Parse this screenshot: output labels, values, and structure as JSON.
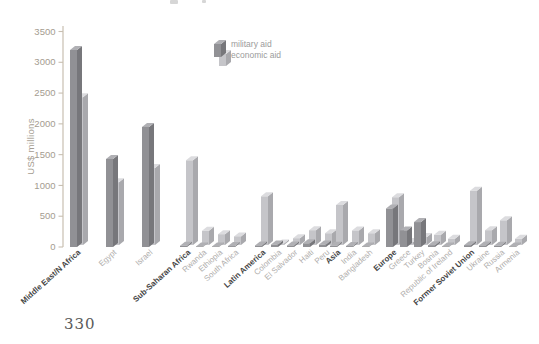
{
  "page": {
    "page_number": "330"
  },
  "chart_data": {
    "type": "bar",
    "ylabel": "US$ millions",
    "ylim": [
      0,
      3500
    ],
    "y_ticks": [
      0,
      500,
      1000,
      1500,
      2000,
      2500,
      3000,
      3500
    ],
    "grid": false,
    "legend_position": "top-center",
    "legend": [
      {
        "name": "military aid",
        "color": "#919195"
      },
      {
        "name": "economic aid",
        "color": "#c5c5c9"
      }
    ],
    "series_names": [
      "military aid",
      "economic aid"
    ],
    "units": "US$ millions",
    "groups": [
      {
        "region": "Middle East/N Africa",
        "entries": [
          {
            "label": "Middle East/N Africa",
            "bold": true,
            "military": 3200,
            "economic": 2400
          },
          {
            "label": "Egypt",
            "bold": false,
            "military": 1430,
            "economic": 1020
          },
          {
            "label": "Israel",
            "bold": false,
            "military": 1950,
            "economic": 1250
          }
        ]
      },
      {
        "region": "Sub-Saharan Africa",
        "entries": [
          {
            "label": "Sub-Saharan Africa",
            "bold": true,
            "military": 20,
            "economic": 1375
          },
          {
            "label": "Rwanda",
            "bold": false,
            "military": 10,
            "economic": 230
          },
          {
            "label": "Ethiopia",
            "bold": false,
            "military": 10,
            "economic": 175
          },
          {
            "label": "South Africa",
            "bold": false,
            "military": 15,
            "economic": 140
          }
        ]
      },
      {
        "region": "Latin America",
        "entries": [
          {
            "label": "Latin America",
            "bold": true,
            "military": 25,
            "economic": 790
          },
          {
            "label": "Colombia",
            "bold": false,
            "military": 40,
            "economic": 25
          },
          {
            "label": "El Salvador",
            "bold": false,
            "military": 25,
            "economic": 110
          },
          {
            "label": "Haiti",
            "bold": false,
            "military": 60,
            "economic": 240
          },
          {
            "label": "Peru",
            "bold": false,
            "military": 40,
            "economic": 190
          }
        ]
      },
      {
        "region": "Asia",
        "entries": [
          {
            "label": "Asia",
            "bold": true,
            "military": 20,
            "economic": 650
          },
          {
            "label": "India",
            "bold": false,
            "military": 15,
            "economic": 235
          },
          {
            "label": "Bangladesh",
            "bold": false,
            "military": 10,
            "economic": 190
          }
        ]
      },
      {
        "region": "Europe",
        "entries": [
          {
            "label": "Europe",
            "bold": true,
            "military": 625,
            "economic": 775
          },
          {
            "label": "Greece",
            "bold": false,
            "military": 270,
            "economic": 50
          },
          {
            "label": "Turkey",
            "bold": false,
            "military": 405,
            "economic": 130
          },
          {
            "label": "Bosnia",
            "bold": false,
            "military": 30,
            "economic": 165
          },
          {
            "label": "Republic of Ireland",
            "bold": false,
            "military": 10,
            "economic": 100
          }
        ]
      },
      {
        "region": "Former Soviet Union",
        "entries": [
          {
            "label": "Former Soviet Union",
            "bold": true,
            "military": 30,
            "economic": 880
          },
          {
            "label": "Ukraine",
            "bold": false,
            "military": 25,
            "economic": 240
          },
          {
            "label": "Russia",
            "bold": false,
            "military": 20,
            "economic": 400
          },
          {
            "label": "Armenia",
            "bold": false,
            "military": 10,
            "economic": 100
          }
        ]
      }
    ],
    "colors": {
      "military": {
        "front": "#919195",
        "side": "#77777b",
        "top": "#b0b0b4"
      },
      "economic": {
        "front": "#c5c5c9",
        "side": "#a9a9ad",
        "top": "#dcdcdf"
      },
      "axis": "#c8bfb1",
      "tick_label": "#a49c90",
      "region_label": "#454545",
      "country_label": "#b0aeac"
    }
  }
}
